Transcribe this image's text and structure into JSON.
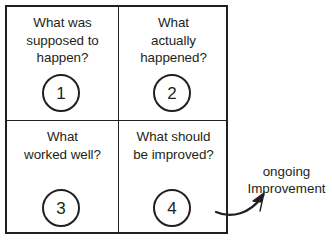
{
  "diagram": {
    "background_color": "#ffffff",
    "ink_color": "#231f20",
    "quadrants": [
      {
        "number": "1",
        "text": "What was\nsupposed to\nhappen?"
      },
      {
        "number": "2",
        "text": "What\nactually\nhappened?"
      },
      {
        "number": "3",
        "text": "What\nworked well?"
      },
      {
        "number": "4",
        "text": "What should\nbe improved?"
      }
    ],
    "callout": {
      "text": "ongoing\nImprovement",
      "arrow": "curved-arrow-up-right"
    }
  }
}
